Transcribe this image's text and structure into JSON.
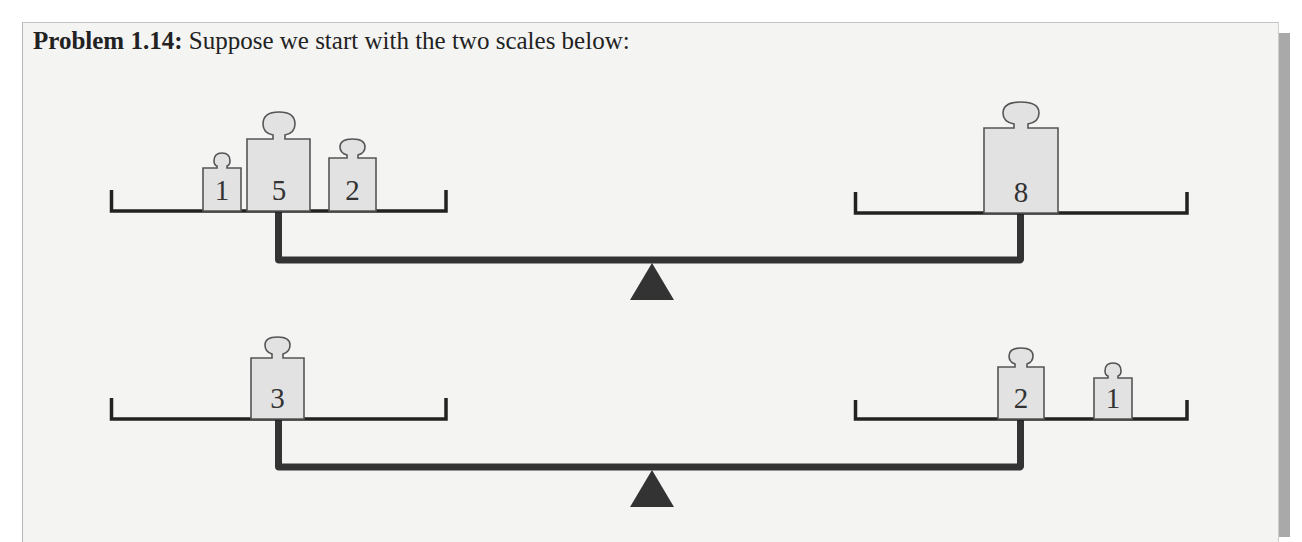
{
  "problem": {
    "label": "Problem 1.14:",
    "text": "Suppose we start with the two scales below:"
  },
  "colors": {
    "box_background": "#f4f4f3",
    "shadow": "#a9a9a9",
    "beam": "#333333",
    "weight_fill": "#e2e2e2",
    "weight_outline": "#555555"
  },
  "scales": [
    {
      "name": "top-scale",
      "left_pan": {
        "weights": [
          {
            "value": "1"
          },
          {
            "value": "5"
          },
          {
            "value": "2"
          }
        ]
      },
      "right_pan": {
        "weights": [
          {
            "value": "8"
          }
        ]
      }
    },
    {
      "name": "bottom-scale",
      "left_pan": {
        "weights": [
          {
            "value": "3"
          }
        ]
      },
      "right_pan": {
        "weights": [
          {
            "value": "2"
          },
          {
            "value": "1"
          }
        ]
      }
    }
  ]
}
